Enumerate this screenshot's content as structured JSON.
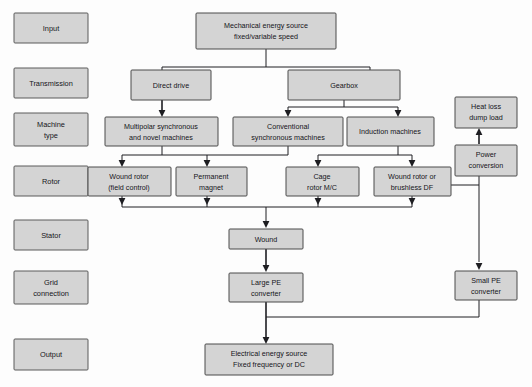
{
  "diagram": {
    "type": "flowchart",
    "colors": {
      "node_fill": "#d4d4d4",
      "node_stroke": "#4a4a4a",
      "link_stroke": "#1e1e22",
      "canvas": "#fdfdfd"
    },
    "stages": [
      {
        "id": "stage-input",
        "label": "Input"
      },
      {
        "id": "stage-transmission",
        "label": "Transmission"
      },
      {
        "id": "stage-machine-type",
        "label": "Machine\ntype",
        "line1": "Machine",
        "line2": "type"
      },
      {
        "id": "stage-rotor",
        "label": "Rotor"
      },
      {
        "id": "stage-stator",
        "label": "Stator"
      },
      {
        "id": "stage-grid-connection",
        "label": "Grid\nconnection",
        "line1": "Grid",
        "line2": "connection"
      },
      {
        "id": "stage-output",
        "label": "Output"
      }
    ],
    "nodes": [
      {
        "id": "mechanical-energy-source",
        "line1": "Mechanical energy source",
        "line2": "fixed/variable speed"
      },
      {
        "id": "direct-drive",
        "line1": "Direct drive",
        "line2": ""
      },
      {
        "id": "gearbox",
        "line1": "Gearbox",
        "line2": ""
      },
      {
        "id": "multipolar-synchronous",
        "line1": "Multipolar synchronous",
        "line2": "and novel machines"
      },
      {
        "id": "conventional-synchronous",
        "line1": "Conventional",
        "line2": "synchronous machines"
      },
      {
        "id": "induction-machines",
        "line1": "Induction machines",
        "line2": ""
      },
      {
        "id": "heat-loss-dump-load",
        "line1": "Heat loss",
        "line2": "dump load"
      },
      {
        "id": "power-conversion",
        "line1": "Power",
        "line2": "conversion"
      },
      {
        "id": "wound-rotor-field-control",
        "line1": "Wound rotor",
        "line2": "(field control)"
      },
      {
        "id": "permanent-magnet",
        "line1": "Permanent",
        "line2": "magnet"
      },
      {
        "id": "cage-rotor-mc",
        "line1": "Cage",
        "line2": "rotor M/C"
      },
      {
        "id": "wound-rotor-brushless-df",
        "line1": "Wound rotor or",
        "line2": "brushless DF"
      },
      {
        "id": "wound",
        "line1": "Wound",
        "line2": ""
      },
      {
        "id": "large-pe-converter",
        "line1": "Large PE",
        "line2": "converter"
      },
      {
        "id": "small-pe-converter",
        "line1": "Small PE",
        "line2": "converter"
      },
      {
        "id": "electrical-energy-source",
        "line1": "Electrical energy source",
        "line2": "Fixed frequency or DC"
      }
    ],
    "edges": [
      {
        "from": "mechanical-energy-source",
        "to": "direct-drive"
      },
      {
        "from": "mechanical-energy-source",
        "to": "gearbox"
      },
      {
        "from": "direct-drive",
        "to": "multipolar-synchronous"
      },
      {
        "from": "gearbox",
        "to": "conventional-synchronous"
      },
      {
        "from": "gearbox",
        "to": "induction-machines"
      },
      {
        "from": "multipolar-synchronous",
        "to": "wound-rotor-field-control"
      },
      {
        "from": "multipolar-synchronous",
        "to": "permanent-magnet"
      },
      {
        "from": "conventional-synchronous",
        "to": "wound-rotor-field-control"
      },
      {
        "from": "conventional-synchronous",
        "to": "permanent-magnet"
      },
      {
        "from": "induction-machines",
        "to": "cage-rotor-mc"
      },
      {
        "from": "induction-machines",
        "to": "wound-rotor-brushless-df"
      },
      {
        "from": "wound-rotor-field-control",
        "to": "wound"
      },
      {
        "from": "permanent-magnet",
        "to": "wound"
      },
      {
        "from": "cage-rotor-mc",
        "to": "wound"
      },
      {
        "from": "wound-rotor-brushless-df",
        "to": "wound"
      },
      {
        "from": "wound-rotor-brushless-df",
        "to": "power-conversion"
      },
      {
        "from": "wound-rotor-brushless-df",
        "to": "small-pe-converter"
      },
      {
        "from": "power-conversion",
        "to": "heat-loss-dump-load"
      },
      {
        "from": "wound",
        "to": "large-pe-converter"
      },
      {
        "from": "large-pe-converter",
        "to": "electrical-energy-source"
      },
      {
        "from": "small-pe-converter",
        "to": "electrical-energy-source"
      }
    ]
  }
}
